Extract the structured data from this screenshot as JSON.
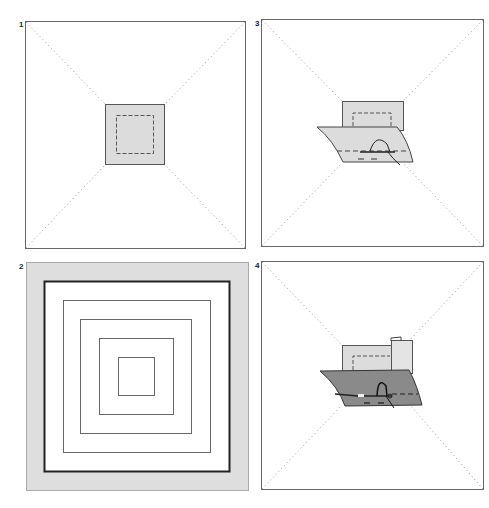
{
  "panels": [
    {
      "number": "1",
      "description": "Small grey square centered on large white square with dotted diagonals; dashed inner square"
    },
    {
      "number": "2",
      "description": "Concentric squares inside grey border"
    },
    {
      "number": "3",
      "description": "Curved grey sheet folded over small square, stitched with needle and thread"
    },
    {
      "number": "4",
      "description": "Dark grey sheet folded over light square with tab, stitched with needle and thread"
    }
  ],
  "colors": {
    "outline": "#555555",
    "light_fill": "#dcdcdc",
    "dark_fill": "#8a8a8a",
    "border_fill": "#dedede",
    "dotted": "#999999"
  }
}
